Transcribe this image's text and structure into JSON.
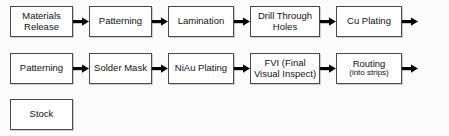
{
  "diagram": {
    "background_color": "#fbfbfb",
    "node_fill": "#ffffff",
    "node_border": "#4a4a4a",
    "arrow_color": "#000000",
    "arrow_icon": "arrow-right-icon",
    "rows": [
      {
        "id": "row-1",
        "nodes": [
          {
            "main": "Materials",
            "sub": "Release",
            "width": "w-std"
          },
          {
            "main": "Patterning",
            "sub": "",
            "width": "w-std"
          },
          {
            "main": "Lamination",
            "sub": "",
            "width": "w-med"
          },
          {
            "main": "Drill Through",
            "sub": "Holes",
            "width": "w-wide"
          },
          {
            "main": "Cu Plating",
            "sub": "",
            "width": "w-med"
          }
        ],
        "trailing_arrow": true
      },
      {
        "id": "row-2",
        "nodes": [
          {
            "main": "Patterning",
            "sub": "",
            "width": "w-std"
          },
          {
            "main": "Solder Mask",
            "sub": "",
            "width": "w-std"
          },
          {
            "main": "NiAu Plating",
            "sub": "",
            "width": "w-med"
          },
          {
            "main": "FVI (Final",
            "sub": "Visual Inspect)",
            "width": "w-wide"
          },
          {
            "main": "Routing",
            "sub": "(into strips)",
            "width": "w-med"
          }
        ],
        "trailing_arrow": true
      },
      {
        "id": "row-3",
        "nodes": [
          {
            "main": "Stock",
            "sub": "",
            "width": "w-std"
          }
        ],
        "trailing_arrow": false
      }
    ]
  }
}
